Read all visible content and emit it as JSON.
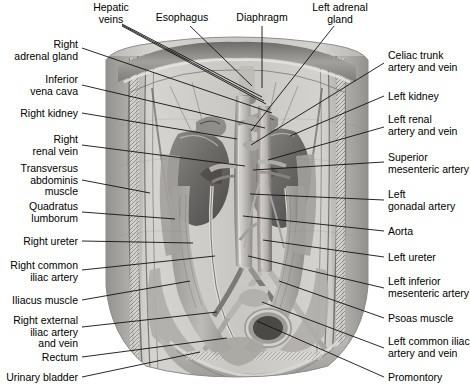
{
  "figure": {
    "style": "grayscale anatomical illustration",
    "width": 470,
    "height": 390,
    "background_color": "#ffffff",
    "line_color": "#111111",
    "text_color": "#000000"
  },
  "labels": {
    "top": [
      {
        "id": "hepatic-veins",
        "text": "Hepatic\nveins",
        "x": 111,
        "y": 2,
        "align": "center"
      },
      {
        "id": "esophagus",
        "text": "Esophagus",
        "x": 182,
        "y": 12,
        "align": "center"
      },
      {
        "id": "diaphragm",
        "text": "Diaphragm",
        "x": 262,
        "y": 12,
        "align": "center"
      },
      {
        "id": "left-adrenal-gland",
        "text": "Left adrenal\ngland",
        "x": 340,
        "y": 2,
        "align": "center"
      }
    ],
    "left": [
      {
        "id": "right-adrenal-gland",
        "text": "Right\nadrenal gland",
        "x": 78,
        "y": 39,
        "align": "right"
      },
      {
        "id": "inferior-vena-cava",
        "text": "Inferior\nvena cava",
        "x": 78,
        "y": 74,
        "align": "right"
      },
      {
        "id": "right-kidney",
        "text": "Right kidney",
        "x": 78,
        "y": 108,
        "align": "right"
      },
      {
        "id": "right-renal-vein",
        "text": "Right\nrenal vein",
        "x": 78,
        "y": 134,
        "align": "right"
      },
      {
        "id": "transversus-abdominis-muscle",
        "text": "Transversus\nabdominis\nmuscle",
        "x": 78,
        "y": 163,
        "align": "right"
      },
      {
        "id": "quadratus-lumborum",
        "text": "Quadratus\nlumborum",
        "x": 78,
        "y": 201,
        "align": "right"
      },
      {
        "id": "right-ureter",
        "text": "Right ureter",
        "x": 78,
        "y": 236,
        "align": "right"
      },
      {
        "id": "right-common-iliac-artery",
        "text": "Right common\niliac artery",
        "x": 78,
        "y": 260,
        "align": "right"
      },
      {
        "id": "iliacus-muscle",
        "text": "Iliacus muscle",
        "x": 78,
        "y": 295,
        "align": "right"
      },
      {
        "id": "right-external-iliac-artery-and-vein",
        "text": "Right external\niliac artery\nand vein",
        "x": 78,
        "y": 315,
        "align": "right"
      },
      {
        "id": "rectum",
        "text": "Rectum",
        "x": 78,
        "y": 352,
        "align": "right"
      },
      {
        "id": "urinary-bladder",
        "text": "Urinary bladder",
        "x": 78,
        "y": 372,
        "align": "right"
      }
    ],
    "right": [
      {
        "id": "celiac-trunk-artery-and-vein",
        "text": "Celiac trunk\nartery and vein",
        "x": 388,
        "y": 50,
        "align": "left"
      },
      {
        "id": "left-kidney",
        "text": "Left kidney",
        "x": 388,
        "y": 91,
        "align": "left"
      },
      {
        "id": "left-renal-artery-and-vein",
        "text": "Left renal\nartery and vein",
        "x": 388,
        "y": 114,
        "align": "left"
      },
      {
        "id": "superior-mesenteric-artery",
        "text": "Superior\nmesenteric artery",
        "x": 388,
        "y": 152,
        "align": "left"
      },
      {
        "id": "left-gonadal-artery",
        "text": "Left\ngonadal artery",
        "x": 388,
        "y": 189,
        "align": "left"
      },
      {
        "id": "aorta",
        "text": "Aorta",
        "x": 388,
        "y": 226,
        "align": "left"
      },
      {
        "id": "left-ureter",
        "text": "Left ureter",
        "x": 388,
        "y": 252,
        "align": "left"
      },
      {
        "id": "left-inferior-mesenteric-artery",
        "text": "Left inferior\nmesenteric artery",
        "x": 388,
        "y": 276,
        "align": "left"
      },
      {
        "id": "psoas-muscle",
        "text": "Psoas muscle",
        "x": 388,
        "y": 313,
        "align": "left"
      },
      {
        "id": "left-common-iliac-artery-and-vein",
        "text": "Left common iliac\nartery and vein",
        "x": 388,
        "y": 336,
        "align": "left"
      },
      {
        "id": "promontory",
        "text": "Promontory",
        "x": 388,
        "y": 372,
        "align": "left"
      }
    ]
  },
  "leader_lines": [
    {
      "id": "hepatic-veins-1",
      "from": [
        122,
        24
      ],
      "to": [
        262,
        97
      ]
    },
    {
      "id": "hepatic-veins-2",
      "from": [
        122,
        25
      ],
      "to": [
        264,
        101
      ]
    },
    {
      "id": "hepatic-veins-3",
      "from": [
        122,
        26
      ],
      "to": [
        266,
        104
      ]
    },
    {
      "id": "esophagus",
      "from": [
        190,
        26
      ],
      "to": [
        252,
        86
      ]
    },
    {
      "id": "diaphragm",
      "from": [
        262,
        26
      ],
      "to": [
        262,
        88
      ]
    },
    {
      "id": "left-adrenal-gland",
      "from": [
        334,
        26
      ],
      "to": [
        251,
        131
      ]
    },
    {
      "id": "right-adrenal-gland",
      "from": [
        82,
        48
      ],
      "to": [
        272,
        113
      ]
    },
    {
      "id": "inferior-vena-cava",
      "from": [
        82,
        85
      ],
      "to": [
        265,
        128
      ]
    },
    {
      "id": "right-kidney",
      "from": [
        82,
        113
      ],
      "to": [
        237,
        139
      ]
    },
    {
      "id": "right-renal-vein",
      "from": [
        82,
        145
      ],
      "to": [
        245,
        166
      ]
    },
    {
      "id": "transversus-abdominis-muscle",
      "from": [
        82,
        180
      ],
      "to": [
        150,
        193
      ]
    },
    {
      "id": "quadratus-lumborum",
      "from": [
        82,
        212
      ],
      "to": [
        175,
        219
      ]
    },
    {
      "id": "right-ureter",
      "from": [
        82,
        241
      ],
      "to": [
        193,
        243
      ]
    },
    {
      "id": "right-common-iliac-artery",
      "from": [
        82,
        270
      ],
      "to": [
        215,
        256
      ]
    },
    {
      "id": "iliacus-muscle",
      "from": [
        82,
        300
      ],
      "to": [
        190,
        281
      ]
    },
    {
      "id": "right-external-iliac-artery-and-vein",
      "from": [
        82,
        327
      ],
      "to": [
        217,
        312
      ]
    },
    {
      "id": "rectum",
      "from": [
        82,
        357
      ],
      "to": [
        227,
        338
      ]
    },
    {
      "id": "urinary-bladder",
      "from": [
        82,
        377
      ],
      "to": [
        200,
        352
      ]
    },
    {
      "id": "celiac-trunk-artery-and-vein",
      "from": [
        384,
        63
      ],
      "to": [
        251,
        145
      ]
    },
    {
      "id": "left-kidney",
      "from": [
        384,
        96
      ],
      "to": [
        290,
        136
      ]
    },
    {
      "id": "left-renal-artery-and-vein",
      "from": [
        384,
        127
      ],
      "to": [
        268,
        160
      ]
    },
    {
      "id": "superior-mesenteric-artery",
      "from": [
        384,
        162
      ],
      "to": [
        253,
        170
      ]
    },
    {
      "id": "left-gonadal-artery",
      "from": [
        384,
        200
      ],
      "to": [
        250,
        194
      ]
    },
    {
      "id": "aorta",
      "from": [
        384,
        231
      ],
      "to": [
        243,
        216
      ]
    },
    {
      "id": "left-ureter",
      "from": [
        384,
        257
      ],
      "to": [
        263,
        240
      ]
    },
    {
      "id": "left-inferior-mesenteric-artery",
      "from": [
        384,
        288
      ],
      "to": [
        248,
        256
      ]
    },
    {
      "id": "psoas-muscle",
      "from": [
        384,
        318
      ],
      "to": [
        279,
        281
      ]
    },
    {
      "id": "left-common-iliac-artery-and-vein",
      "from": [
        384,
        348
      ],
      "to": [
        262,
        302
      ]
    },
    {
      "id": "promontory",
      "from": [
        384,
        377
      ],
      "to": [
        257,
        321
      ]
    }
  ]
}
